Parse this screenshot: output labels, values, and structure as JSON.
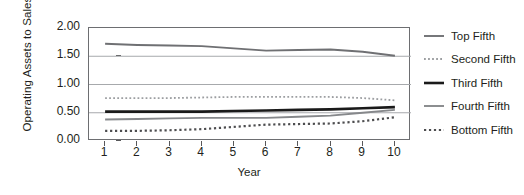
{
  "chart_data": {
    "type": "line",
    "title": "",
    "xlabel": "Year",
    "ylabel": "Operating Assets to Sales",
    "x": [
      1,
      2,
      3,
      4,
      5,
      6,
      7,
      8,
      9,
      10
    ],
    "xticklabels": [
      "1",
      "2",
      "3",
      "4",
      "5",
      "6",
      "7",
      "8",
      "9",
      "10"
    ],
    "xlim": [
      0.5,
      10.5
    ],
    "ylim": [
      0.0,
      2.0
    ],
    "yticks": [
      0.0,
      0.5,
      1.0,
      1.5,
      2.0
    ],
    "yticklabels": [
      "0.00",
      "0.50",
      "1.00",
      "1.50",
      "2.00"
    ],
    "grid": "horizontal",
    "legend_position": "right",
    "series": [
      {
        "name": "Top Fifth",
        "style": "solid",
        "color": "#6f7073",
        "width": 1.9,
        "values": [
          1.72,
          1.7,
          1.69,
          1.68,
          1.64,
          1.6,
          1.61,
          1.62,
          1.58,
          1.51
        ]
      },
      {
        "name": "Second Fifth",
        "style": "dotted",
        "color": "#9c9ea1",
        "width": 1.8,
        "values": [
          0.76,
          0.76,
          0.76,
          0.77,
          0.78,
          0.78,
          0.78,
          0.78,
          0.76,
          0.72
        ]
      },
      {
        "name": "Third Fifth",
        "style": "solid",
        "color": "#1a1a1a",
        "width": 2.6,
        "values": [
          0.52,
          0.52,
          0.52,
          0.52,
          0.53,
          0.54,
          0.55,
          0.56,
          0.58,
          0.6
        ]
      },
      {
        "name": "Fourth Fifth",
        "style": "solid",
        "color": "#86888b",
        "width": 1.9,
        "values": [
          0.38,
          0.39,
          0.4,
          0.41,
          0.41,
          0.41,
          0.43,
          0.45,
          0.5,
          0.55
        ]
      },
      {
        "name": "Bottom Fifth",
        "style": "dotted",
        "color": "#4d4d4f",
        "width": 2.2,
        "values": [
          0.18,
          0.18,
          0.19,
          0.21,
          0.25,
          0.29,
          0.3,
          0.31,
          0.35,
          0.42
        ]
      }
    ]
  },
  "axis": {
    "ylabel": "Operating Assets to Sales",
    "xlabel": "Year"
  },
  "legend": {
    "items": [
      {
        "label": "Top Fifth"
      },
      {
        "label": "Second Fifth"
      },
      {
        "label": "Third Fifth"
      },
      {
        "label": "Fourth Fifth"
      },
      {
        "label": "Bottom Fifth"
      }
    ]
  },
  "colors": {
    "frame": "#6d6e71",
    "gridline": "#a7a9ac",
    "text": "#231f20",
    "background": "#ffffff"
  }
}
